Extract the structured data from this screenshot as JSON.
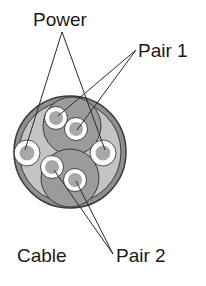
{
  "labels": {
    "power": "Power",
    "pair1": "Pair 1",
    "pair2": "Pair 2",
    "cable": "Cable"
  },
  "colors": {
    "outline": "#3a3a3a",
    "jacket": "#8f8f8f",
    "filler": "#c4c4c4",
    "pair_shield": "#9b9b9b",
    "conductor_fill": "#a8a8a8",
    "insulation": "#ffffff"
  }
}
